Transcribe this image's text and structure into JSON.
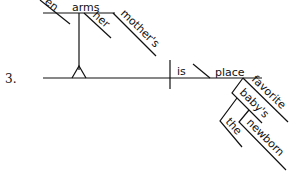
{
  "item_number": "3.",
  "diagram": {
    "type": "sentence-diagram",
    "subject": {
      "word": "arms",
      "modifiers": [
        "her",
        "mother's"
      ],
      "partial_word_cut": "en"
    },
    "verb": "is",
    "predicate_nominative": {
      "word": "place",
      "modifiers": [
        "favorite",
        "baby's"
      ],
      "baby_modifiers": [
        "the",
        "newborn"
      ]
    }
  }
}
